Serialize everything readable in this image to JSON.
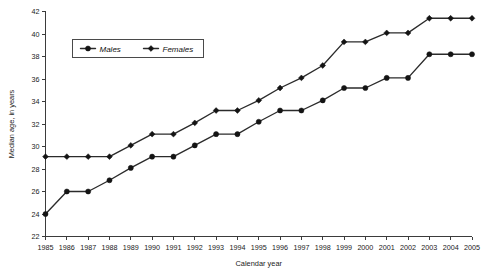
{
  "chart_data": {
    "type": "line",
    "title": "",
    "xlabel": "Calendar year",
    "ylabel": "Median age, in years",
    "grid": false,
    "legend_position": "top-left-inside",
    "x": [
      1985,
      1986,
      1987,
      1988,
      1989,
      1990,
      1991,
      1992,
      1993,
      1994,
      1995,
      1996,
      1997,
      1998,
      1999,
      2000,
      2001,
      2002,
      2003,
      2004,
      2005
    ],
    "categories": [
      "1985",
      "1986",
      "1987",
      "1988",
      "1989",
      "1990",
      "1991",
      "1992",
      "1993",
      "1994",
      "1995",
      "1996",
      "1997",
      "1998",
      "1999",
      "2000",
      "2001",
      "2002",
      "2003",
      "2004",
      "2005"
    ],
    "xlim": [
      1985,
      2005
    ],
    "ylim": [
      22,
      42
    ],
    "yticks": [
      22,
      24,
      26,
      28,
      30,
      32,
      34,
      36,
      38,
      40,
      42
    ],
    "ytick_labels": [
      "22",
      "24",
      "26",
      "28",
      "30",
      "32",
      "34",
      "36",
      "38",
      "40",
      "42"
    ],
    "series": [
      {
        "name": "Males",
        "marker": "circle",
        "color": "#1a1a1a",
        "values": [
          24.0,
          26.0,
          26.0,
          27.0,
          28.1,
          29.1,
          29.1,
          30.1,
          31.1,
          31.1,
          32.2,
          33.2,
          33.2,
          34.1,
          35.2,
          35.2,
          36.1,
          36.1,
          38.2,
          38.2,
          38.2
        ]
      },
      {
        "name": "Females",
        "marker": "diamond",
        "color": "#1a1a1a",
        "values": [
          29.1,
          29.1,
          29.1,
          29.1,
          30.1,
          31.1,
          31.1,
          32.1,
          33.2,
          33.2,
          34.1,
          35.2,
          36.1,
          37.2,
          39.3,
          39.3,
          40.1,
          40.1,
          41.4,
          41.4,
          41.4
        ]
      }
    ]
  },
  "legend": {
    "entries": [
      {
        "label": "Males",
        "marker": "circle"
      },
      {
        "label": "Females",
        "marker": "diamond"
      }
    ]
  }
}
